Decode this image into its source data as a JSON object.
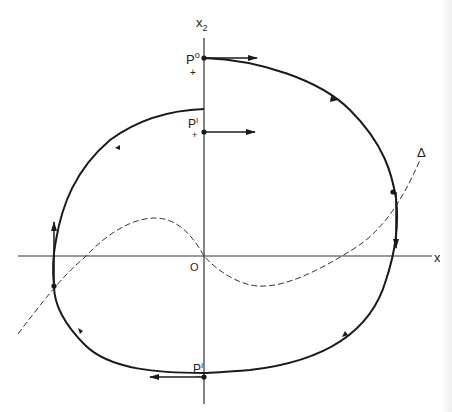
{
  "diagram": {
    "type": "phase-portrait",
    "colors": {
      "ink": "#1a1a1a",
      "axis": "#333333",
      "background": "#ffffff"
    },
    "axes": {
      "x_label": "x",
      "x_sub": "1",
      "y_label": "x",
      "y_sub": "2",
      "origin_label": "O"
    },
    "curve_label": "Δ",
    "points": {
      "p_plus_0": {
        "base": "P",
        "sup": "o",
        "sub": "+"
      },
      "p_plus_1": {
        "base": "P",
        "sup": "I",
        "sub": "+"
      },
      "p_minus_1": {
        "base": "P",
        "sup": "I",
        "sub": "−"
      }
    }
  }
}
